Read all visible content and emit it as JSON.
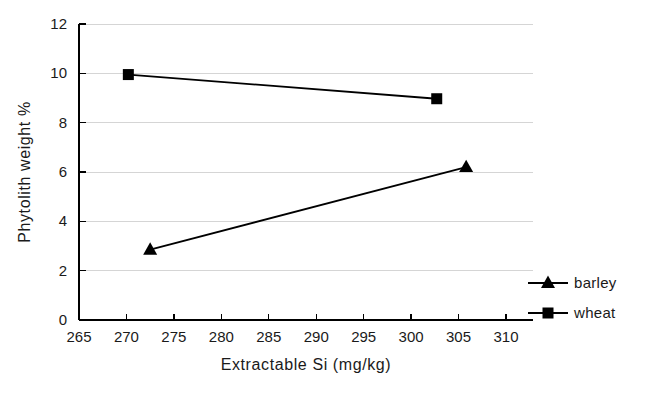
{
  "chart_data": {
    "type": "line",
    "title": "",
    "xlabel": "Extractable Si (mg/kg)",
    "ylabel": "Phytolith weight %",
    "xlim": [
      265,
      310
    ],
    "ylim": [
      0,
      12
    ],
    "xticks": [
      265,
      270,
      275,
      280,
      285,
      290,
      295,
      300,
      305,
      310
    ],
    "yticks": [
      0,
      2,
      4,
      6,
      8,
      10,
      12
    ],
    "xtick_labels": [
      "265",
      "270",
      "275",
      "280",
      "285",
      "290",
      "295",
      "300",
      "305",
      "310"
    ],
    "ytick_labels": [
      "0",
      "2",
      "4",
      "6",
      "8",
      "10",
      "12"
    ],
    "grid": "horizontal",
    "legend_position": "right-bottom",
    "series": [
      {
        "name": "barley",
        "marker": "triangle",
        "color": "#000000",
        "x": [
          272.5,
          305.8
        ],
        "y": [
          2.85,
          6.2
        ]
      },
      {
        "name": "wheat",
        "marker": "square",
        "color": "#000000",
        "x": [
          270.2,
          302.7
        ],
        "y": [
          9.95,
          8.97
        ]
      }
    ]
  },
  "legend": {
    "entries": [
      {
        "label": "barley"
      },
      {
        "label": "wheat"
      }
    ]
  },
  "axes": {
    "x_title": "Extractable Si (mg/kg)",
    "y_title": "Phytolith weight %"
  },
  "colors": {
    "ink": "#000000",
    "grid": "#d5d5d5",
    "background": "#ffffff"
  }
}
